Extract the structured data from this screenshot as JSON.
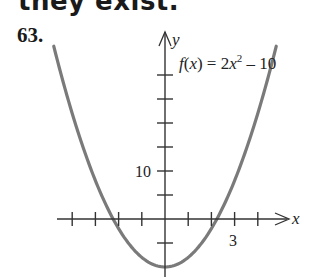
{
  "header": {
    "heading_text": "they exist."
  },
  "problem": {
    "number": "63."
  },
  "chart_data": {
    "type": "line",
    "function": "f(x) = 2x^2 - 10",
    "xlabel": "x",
    "ylabel": "y",
    "x_tick_step": 1,
    "y_tick_step": 5,
    "x_ticks": [
      -4,
      -3,
      -2,
      -1,
      1,
      2,
      3,
      4
    ],
    "y_ticks": [
      -5,
      5,
      10,
      15,
      20,
      25,
      30
    ],
    "labeled_ticks": {
      "x": [
        3
      ],
      "y": [
        10
      ]
    },
    "xlim": [
      -4.6,
      4.6
    ],
    "ylim": [
      -10,
      36
    ],
    "vertex": [
      0,
      -10
    ],
    "x_intercepts": [
      -2.236,
      2.236
    ],
    "series": [
      {
        "name": "f(x)",
        "x": [
          -4.8,
          -4,
          -3,
          -2,
          -1,
          0,
          1,
          2,
          3,
          4,
          4.8
        ],
        "y": [
          36.08,
          22,
          8,
          -2,
          -8,
          -10,
          -8,
          -2,
          8,
          22,
          36.08
        ]
      }
    ],
    "grid": false,
    "legend": "none",
    "curve_color": "#7a7a7a",
    "axis_color": "#333333"
  },
  "labels": {
    "function_label_prefix": "f(x) = 2x",
    "function_label_exp": "2",
    "function_label_suffix": " – 10",
    "y_axis_label": "y",
    "x_axis_label": "x",
    "y_tick_label": "10",
    "x_tick_label": "3"
  }
}
